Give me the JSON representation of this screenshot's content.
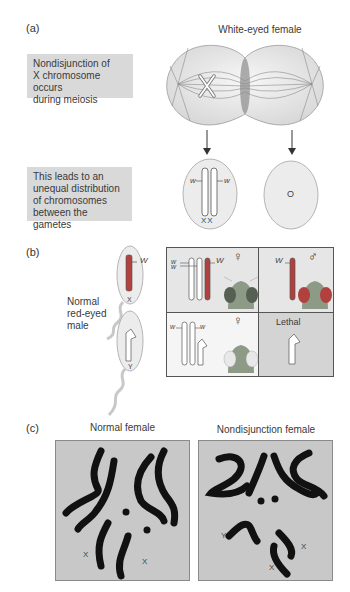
{
  "panel_a": {
    "label": "(a)",
    "title": "White-eyed female",
    "note_1": "Nondisjunction of X chromosome occurs during meiosis",
    "note_1_lines": [
      "Nondisjunction of",
      "X chromosome occurs",
      "during meiosis"
    ],
    "note_2_lines": [
      "This leads to an",
      "unequal distribution",
      "of chromosomes",
      "between the gametes"
    ],
    "gamete_left": {
      "allele_left": "w",
      "allele_right": "w",
      "karyotype": "XX"
    },
    "gamete_right": {
      "karyotype": "O"
    }
  },
  "panel_b": {
    "label": "(b)",
    "male_label_lines": [
      "Normal",
      "red-eyed",
      "male"
    ],
    "sperm_x": {
      "allele": "W",
      "chromosome": "X"
    },
    "sperm_y": {
      "chromosome": "Y"
    },
    "grid": {
      "top_left": {
        "alleles": [
          "w",
          "w",
          "W"
        ],
        "sex_symbol": "♀"
      },
      "top_right": {
        "alleles": [
          "W"
        ],
        "sex_symbol": "♂"
      },
      "bottom_left": {
        "alleles": [
          "w",
          "w"
        ],
        "sex_symbol": "♀"
      },
      "bottom_right": {
        "label": "Lethal"
      }
    }
  },
  "panel_c": {
    "label": "(c)",
    "left_title": "Normal female",
    "right_title": "Nondisjunction female",
    "left_labels": [
      "X",
      "X"
    ],
    "right_labels": [
      "Y",
      "X",
      "X"
    ]
  },
  "colors": {
    "note_bg": "#d9d9d9",
    "cell_bg": "#e6e6e6",
    "red_chromosome": "#b0413e",
    "lethal_bg": "#d4d4d4",
    "micrograph_bg": "#c8c8c8"
  }
}
